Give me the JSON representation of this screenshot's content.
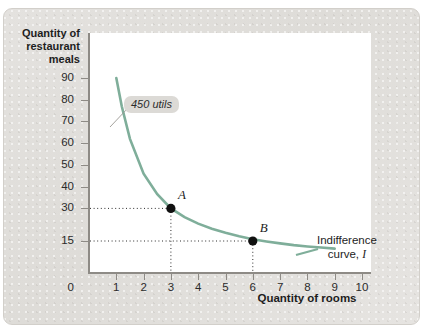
{
  "chart_data": {
    "type": "line",
    "title": "",
    "xlabel": "Quantity of rooms",
    "ylabel": "Quantity of restaurant meals",
    "xlim": [
      0,
      10.8
    ],
    "ylim": [
      0,
      100
    ],
    "grid": false,
    "legend_position": "inline-right",
    "x_ticks": [
      "0",
      "1",
      "2",
      "3",
      "4",
      "5",
      "6",
      "7",
      "8",
      "9",
      "10"
    ],
    "y_ticks": [
      "15",
      "30",
      "40",
      "50",
      "60",
      "70",
      "80",
      "90"
    ],
    "series": [
      {
        "name": "Indifference curve, I",
        "color": "#7fae9a",
        "note": "450 utils",
        "x": [
          1.0,
          1.2,
          1.5,
          2.0,
          2.5,
          3.0,
          3.5,
          4.0,
          4.5,
          5.0,
          5.5,
          6.0,
          6.5,
          7.0,
          7.5,
          8.0,
          8.5,
          9.0
        ],
        "y": [
          90.0,
          77.0,
          62.0,
          46.0,
          36.5,
          30.0,
          26.0,
          23.0,
          20.6,
          18.8,
          17.2,
          15.8,
          14.8,
          13.9,
          13.1,
          12.5,
          12.0,
          11.5
        ]
      }
    ],
    "points": [
      {
        "label": "A",
        "x": 3,
        "y": 30
      },
      {
        "label": "B",
        "x": 6,
        "y": 15
      }
    ],
    "annotations": [
      {
        "name": "utils-callout",
        "text": "450 utils"
      },
      {
        "name": "curve-label-line1",
        "text": "Indifference"
      },
      {
        "name": "curve-label-line2",
        "text": "curve,"
      },
      {
        "name": "curve-label-symbol",
        "text": "I"
      }
    ]
  },
  "axes": {
    "y_title": "Quantity of\nrestaurant\nmeals",
    "y_title_line1": "Quantity of",
    "y_title_line2": "restaurant",
    "y_title_line3": "meals",
    "x_title": "Quantity of rooms",
    "origin_label": "0"
  },
  "colors": {
    "curve": "#7fae9a",
    "panel_background": "#e2e0dc",
    "plot_background": "#ffffff",
    "axis": "#8e8b86",
    "point": "#111111",
    "callout_background": "#dcdad6",
    "text": "#1d1d1d"
  }
}
